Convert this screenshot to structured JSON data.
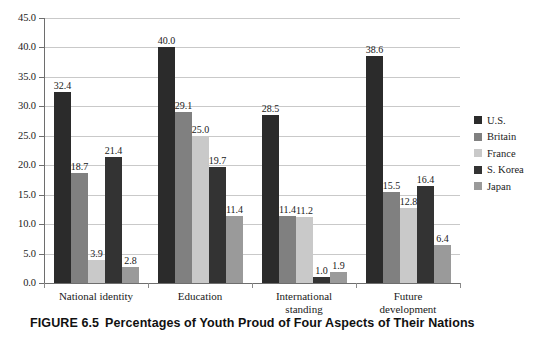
{
  "caption": {
    "figure_number": "FIGURE 6.5",
    "title": "Percentages of Youth Proud of Four Aspects of Their Nations"
  },
  "axes": {
    "y_ticks": [
      "45.0",
      "40.0",
      "35.0",
      "30.0",
      "25.0",
      "20.0",
      "15.0",
      "10.0",
      "5.0",
      "0.0"
    ],
    "y_min": 0,
    "y_max": 45,
    "y_step": 5
  },
  "legend": {
    "items": [
      {
        "label": "U.S.",
        "color": "#2b2b2b"
      },
      {
        "label": "Britain",
        "color": "#808080"
      },
      {
        "label": "France",
        "color": "#c9c9c9"
      },
      {
        "label": "S. Korea",
        "color": "#333333"
      },
      {
        "label": "Japan",
        "color": "#9a9a9a"
      }
    ]
  },
  "chart_data": {
    "type": "bar",
    "title": "Percentages of Youth Proud of Four Aspects of Their Nations",
    "xlabel": "",
    "ylabel": "",
    "ylim": [
      0,
      45
    ],
    "grid": true,
    "legend_position": "right",
    "categories": [
      "National identity",
      "Education",
      "International standing",
      "Future development"
    ],
    "category_lines": [
      [
        "National identity"
      ],
      [
        "Education"
      ],
      [
        "International",
        "standing"
      ],
      [
        "Future",
        "development"
      ]
    ],
    "series": [
      {
        "name": "U.S.",
        "color": "#2b2b2b",
        "values": [
          32.4,
          40.0,
          28.5,
          38.6
        ]
      },
      {
        "name": "Britain",
        "color": "#808080",
        "values": [
          18.7,
          29.1,
          11.4,
          15.5
        ]
      },
      {
        "name": "France",
        "color": "#c9c9c9",
        "values": [
          3.9,
          25.0,
          11.2,
          12.8
        ]
      },
      {
        "name": "S. Korea",
        "color": "#333333",
        "values": [
          21.4,
          19.7,
          1.0,
          16.4
        ]
      },
      {
        "name": "Japan",
        "color": "#9a9a9a",
        "values": [
          2.8,
          11.4,
          1.9,
          6.4
        ]
      }
    ],
    "value_labels": [
      [
        "32.4",
        "18.7",
        "3.9",
        "21.4",
        "2.8"
      ],
      [
        "40.0",
        "29.1",
        "25.0",
        "19.7",
        "11.4"
      ],
      [
        "28.5",
        "11.4",
        "11.2",
        "1.0",
        "1.9"
      ],
      [
        "38.6",
        "15.5",
        "12.8",
        "16.4",
        "6.4"
      ]
    ]
  }
}
